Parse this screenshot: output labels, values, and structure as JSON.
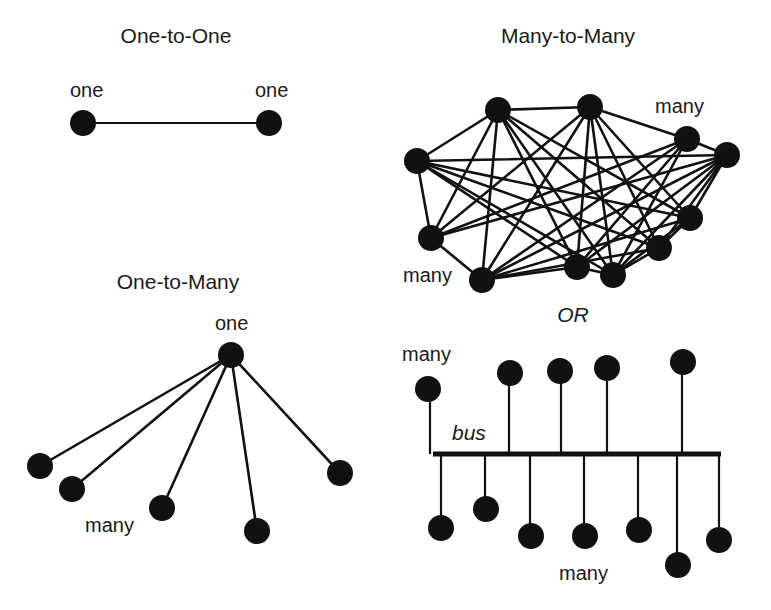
{
  "figure": {
    "width": 771,
    "height": 610,
    "colors": {
      "ink": "#111111",
      "background": "#ffffff"
    },
    "node_radius": 13
  },
  "panels": {
    "one_to_one": {
      "title": "One-to-One",
      "title_pos": [
        176,
        43
      ],
      "labels": [
        {
          "text": "one",
          "x": 70,
          "y": 97
        },
        {
          "text": "one",
          "x": 255,
          "y": 97
        }
      ],
      "nodes": [
        [
          83,
          123
        ],
        [
          269,
          123
        ]
      ],
      "edges": [
        [
          0,
          1
        ]
      ]
    },
    "many_to_many": {
      "title": "Many-to-Many",
      "title_pos": [
        568,
        43
      ],
      "labels": [
        {
          "text": "many",
          "x": 655,
          "y": 113
        },
        {
          "text": "many",
          "x": 403,
          "y": 282
        }
      ],
      "nodes": [
        [
          498,
          110
        ],
        [
          590,
          107
        ],
        [
          687,
          139
        ],
        [
          727,
          155
        ],
        [
          417,
          161
        ],
        [
          431,
          238
        ],
        [
          482,
          280
        ],
        [
          577,
          267
        ],
        [
          613,
          275
        ],
        [
          659,
          248
        ],
        [
          690,
          218
        ]
      ],
      "edges": [
        [
          0,
          1
        ],
        [
          0,
          4
        ],
        [
          0,
          5
        ],
        [
          0,
          6
        ],
        [
          0,
          7
        ],
        [
          0,
          8
        ],
        [
          0,
          9
        ],
        [
          0,
          10
        ],
        [
          1,
          2
        ],
        [
          1,
          5
        ],
        [
          1,
          6
        ],
        [
          1,
          7
        ],
        [
          1,
          8
        ],
        [
          1,
          9
        ],
        [
          1,
          10
        ],
        [
          2,
          3
        ],
        [
          2,
          5
        ],
        [
          2,
          6
        ],
        [
          2,
          7
        ],
        [
          2,
          8
        ],
        [
          3,
          4
        ],
        [
          3,
          5
        ],
        [
          3,
          6
        ],
        [
          3,
          7
        ],
        [
          3,
          8
        ],
        [
          3,
          9
        ],
        [
          3,
          10
        ],
        [
          4,
          5
        ],
        [
          4,
          7
        ],
        [
          4,
          8
        ],
        [
          4,
          9
        ],
        [
          4,
          10
        ],
        [
          5,
          6
        ],
        [
          5,
          2
        ],
        [
          6,
          7
        ],
        [
          6,
          9
        ],
        [
          6,
          10
        ],
        [
          7,
          8
        ],
        [
          8,
          9
        ],
        [
          9,
          10
        ],
        [
          8,
          10
        ]
      ]
    },
    "one_to_many": {
      "title": "One-to-Many",
      "title_pos": [
        178,
        289
      ],
      "labels": [
        {
          "text": "one",
          "x": 215,
          "y": 330
        },
        {
          "text": "many",
          "x": 85,
          "y": 532
        }
      ],
      "hub": [
        231,
        355
      ],
      "leaves": [
        [
          40,
          466
        ],
        [
          72,
          489
        ],
        [
          162,
          508
        ],
        [
          257,
          531
        ],
        [
          340,
          473
        ]
      ]
    },
    "bus": {
      "or_label": "OR",
      "or_pos": [
        573,
        322
      ],
      "bus_label": "bus",
      "bus_label_pos": [
        452,
        440
      ],
      "labels": [
        {
          "text": "many",
          "x": 402,
          "y": 361
        },
        {
          "text": "many",
          "x": 559,
          "y": 580
        }
      ],
      "line": {
        "x1": 433,
        "x2": 721,
        "y": 454
      },
      "top_nodes": [
        {
          "x": 428,
          "y": 389,
          "stem_x": 430
        },
        {
          "x": 510,
          "y": 373,
          "stem_x": 509
        },
        {
          "x": 560,
          "y": 371,
          "stem_x": 561
        },
        {
          "x": 607,
          "y": 368,
          "stem_x": 607
        },
        {
          "x": 683,
          "y": 362,
          "stem_x": 682
        }
      ],
      "bottom_nodes": [
        {
          "x": 441,
          "y": 528,
          "stem_x": 441
        },
        {
          "x": 486,
          "y": 509,
          "stem_x": 485
        },
        {
          "x": 531,
          "y": 536,
          "stem_x": 530
        },
        {
          "x": 585,
          "y": 536,
          "stem_x": 584
        },
        {
          "x": 639,
          "y": 530,
          "stem_x": 638
        },
        {
          "x": 678,
          "y": 565,
          "stem_x": 677
        },
        {
          "x": 719,
          "y": 540,
          "stem_x": 719
        }
      ]
    }
  }
}
